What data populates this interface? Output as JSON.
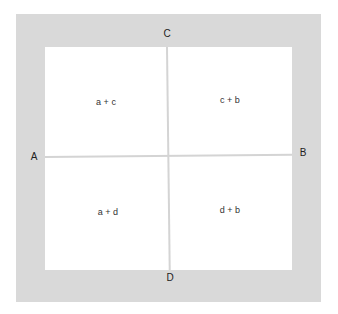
{
  "diagram": {
    "edges": {
      "top": "C",
      "bottom": "D",
      "left": "A",
      "right": "B"
    },
    "cells": {
      "top_left": "a + c",
      "top_right": "c + b",
      "bottom_left": "a + d",
      "bottom_right": "d + b"
    },
    "colors": {
      "frame": "#d9d9d9",
      "inner": "#ffffff",
      "divider": "#d4d4d4",
      "text": "#222222"
    }
  }
}
